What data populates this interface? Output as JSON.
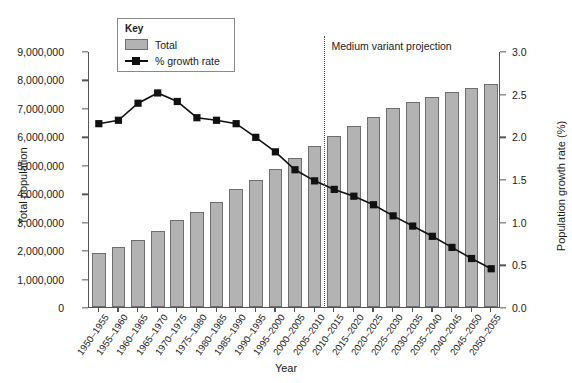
{
  "chart_data": {
    "type": "bar",
    "title": "",
    "xlabel": "Year",
    "ylabel": "Total population",
    "ylabel_right": "Population growth rate (%)",
    "grid": false,
    "legend_position": "top-left",
    "legend_title": "Key",
    "categories": [
      "1950–1955",
      "1955–1960",
      "1960–1965",
      "1965–1970",
      "1970–1975",
      "1975–1980",
      "1980–1985",
      "1985–1990",
      "1990–1995",
      "1995–2000",
      "2000–2005",
      "2005–2010",
      "2010–2015",
      "2015–2020",
      "2020–2025",
      "2025–2030",
      "2030–2035",
      "2035–2040",
      "2040–2045",
      "2045–2050",
      "2050–2055"
    ],
    "series": [
      {
        "name": "Total",
        "type": "bar",
        "axis": "left",
        "color": "#b3b3b3",
        "edge_color": "#6e6e6e",
        "values": [
          1900000,
          2110000,
          2350000,
          2690000,
          3070000,
          3340000,
          3700000,
          4150000,
          4470000,
          4850000,
          5240000,
          5660000,
          6010000,
          6350000,
          6680000,
          7000000,
          7210000,
          7380000,
          7560000,
          7700000,
          7850000
        ]
      },
      {
        "name": "% growth rate",
        "type": "line",
        "axis": "right",
        "color": "#111111",
        "marker": "square",
        "values": [
          2.16,
          2.2,
          2.4,
          2.52,
          2.42,
          2.23,
          2.2,
          2.16,
          2.0,
          1.83,
          1.62,
          1.49,
          1.39,
          1.31,
          1.21,
          1.08,
          0.96,
          0.84,
          0.71,
          0.58,
          0.46
        ]
      }
    ],
    "ylim_left": [
      0,
      9000000
    ],
    "ylim_right": [
      0.0,
      3.0
    ],
    "ytick_labels_left": [
      "0",
      "1,000,000",
      "2,000,000",
      "3,000,000",
      "4,000,000",
      "5,000,000",
      "6,000,000",
      "7,000,000",
      "8,000,000",
      "9,000,000"
    ],
    "ytick_values_left": [
      0,
      1000000,
      2000000,
      3000000,
      4000000,
      5000000,
      6000000,
      7000000,
      8000000,
      9000000
    ],
    "ytick_labels_right": [
      "0.0",
      "0.5",
      "1.0",
      "1.5",
      "2.0",
      "2.5",
      "3.0"
    ],
    "ytick_values_right": [
      0.0,
      0.5,
      1.0,
      1.5,
      2.0,
      2.5,
      3.0
    ],
    "annotations": [
      {
        "text": "Medium variant projection",
        "type": "divider-label",
        "divider_after_category": "2005–2010"
      }
    ]
  },
  "legend": {
    "title": "Key",
    "items": [
      {
        "label": "Total",
        "marker": "bar-swatch"
      },
      {
        "label": "% growth rate",
        "marker": "line-square-marker"
      }
    ]
  },
  "axes": {
    "left_title": "Total population",
    "right_title": "Population growth rate (%)",
    "x_title": "Year"
  },
  "annotation": {
    "projection_label": "Medium variant projection"
  }
}
